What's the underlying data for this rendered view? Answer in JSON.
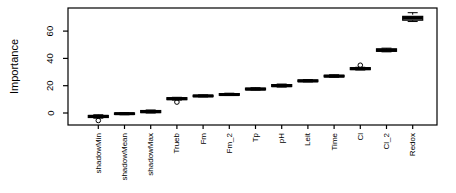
{
  "figure": {
    "background": "#ffffff",
    "ink_color": "#000000"
  },
  "chart_data": {
    "type": "boxplot",
    "ylabel": "Importance",
    "xlabel": "",
    "ylim": [
      -9,
      77
    ],
    "yticks": [
      0,
      20,
      40,
      60
    ],
    "grid": false,
    "x_labels_rotated": true,
    "categories": [
      "shadowMin",
      "shadowMean",
      "shadowMax",
      "Trueb",
      "Fm",
      "Fm_2",
      "Tp",
      "pH",
      "Leit",
      "Time",
      "Cl",
      "Cl_2",
      "Redox"
    ],
    "series": [
      {
        "label": "shadowMin",
        "whisker_low": -3.8,
        "q1": -3.3,
        "median": -2.5,
        "q3": -1.8,
        "whisker_high": -1.3,
        "outliers": [
          -5.5
        ]
      },
      {
        "label": "shadowMean",
        "whisker_low": -1.3,
        "q1": -1.0,
        "median": -0.5,
        "q3": 0.0,
        "whisker_high": 0.3,
        "outliers": []
      },
      {
        "label": "shadowMax",
        "whisker_low": 0.0,
        "q1": 0.3,
        "median": 1.0,
        "q3": 1.8,
        "whisker_high": 2.2,
        "outliers": []
      },
      {
        "label": "Trueb",
        "whisker_low": 9.5,
        "q1": 9.8,
        "median": 10.5,
        "q3": 11.2,
        "whisker_high": 11.5,
        "outliers": [
          8.0
        ]
      },
      {
        "label": "Fm",
        "whisker_low": 11.8,
        "q1": 12.0,
        "median": 12.5,
        "q3": 13.0,
        "whisker_high": 13.3,
        "outliers": []
      },
      {
        "label": "Fm_2",
        "whisker_low": 12.8,
        "q1": 13.0,
        "median": 13.5,
        "q3": 14.2,
        "whisker_high": 14.5,
        "outliers": []
      },
      {
        "label": "Tp",
        "whisker_low": 16.8,
        "q1": 17.0,
        "median": 17.5,
        "q3": 18.2,
        "whisker_high": 18.5,
        "outliers": []
      },
      {
        "label": "pH",
        "whisker_low": 19.0,
        "q1": 19.4,
        "median": 20.0,
        "q3": 20.8,
        "whisker_high": 21.2,
        "outliers": []
      },
      {
        "label": "Leit",
        "whisker_low": 22.8,
        "q1": 23.0,
        "median": 23.5,
        "q3": 24.2,
        "whisker_high": 24.5,
        "outliers": []
      },
      {
        "label": "Time",
        "whisker_low": 26.2,
        "q1": 26.5,
        "median": 27.0,
        "q3": 27.6,
        "whisker_high": 28.0,
        "outliers": []
      },
      {
        "label": "Cl",
        "whisker_low": 31.5,
        "q1": 31.8,
        "median": 32.5,
        "q3": 33.2,
        "whisker_high": 33.5,
        "outliers": [
          35.0
        ]
      },
      {
        "label": "Cl_2",
        "whisker_low": 44.8,
        "q1": 45.2,
        "median": 46.0,
        "q3": 47.0,
        "whisker_high": 47.5,
        "outliers": []
      },
      {
        "label": "Redox",
        "whisker_low": 67.0,
        "q1": 68.0,
        "median": 69.5,
        "q3": 70.8,
        "whisker_high": 73.5,
        "outliers": []
      }
    ]
  }
}
